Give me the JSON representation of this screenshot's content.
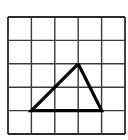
{
  "figure": {
    "title": "Triangle on square grid",
    "caption": "",
    "background_color": "#ffffff"
  },
  "grid": {
    "name": "square-grid",
    "columns": 5,
    "rows": 5,
    "cell_size": 23.4,
    "origin_x": 8,
    "origin_y": 17,
    "line_color": "#3a3a3a",
    "line_width": 1.4,
    "border_color": "#2b2b2b",
    "border_width": 1.8,
    "x_lines": [
      8,
      31.4,
      54.8,
      78.2,
      101.6,
      125
    ],
    "y_lines": [
      17,
      40.4,
      63.8,
      87.2,
      110.6,
      134
    ]
  },
  "shape": {
    "name": "triangle",
    "type": "polygon",
    "stroke_color": "#000000",
    "stroke_width": 3.2,
    "fill": "none",
    "vertices": [
      {
        "label": "apex",
        "grid_col": 3,
        "grid_row": 2,
        "x": 78.2,
        "y": 63.8
      },
      {
        "label": "bottom-left",
        "grid_col": 1,
        "grid_row": 4,
        "x": 31.4,
        "y": 110.6
      },
      {
        "label": "bottom-right",
        "grid_col": 4,
        "grid_row": 4,
        "x": 101.6,
        "y": 110.6
      }
    ],
    "base_units": 3,
    "height_units": 2
  },
  "chart_data": {
    "type": "scatter",
    "title": "Triangle on square grid",
    "xlabel": "",
    "ylabel": "",
    "xlim": [
      0,
      5
    ],
    "ylim": [
      0,
      5
    ],
    "grid": true,
    "legend": "none",
    "series": [
      {
        "name": "triangle",
        "x": [
          1,
          3,
          4,
          1
        ],
        "y": [
          1,
          3,
          1,
          1
        ]
      }
    ],
    "annotations": []
  }
}
